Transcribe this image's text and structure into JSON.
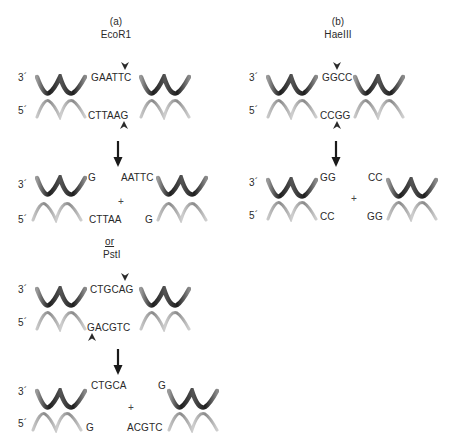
{
  "panels": {
    "a": {
      "label": "(a)",
      "enzyme": "EcoR1",
      "before": {
        "top_seq": "GAATTC",
        "bottom_seq": "CTTAAG"
      },
      "after": {
        "left_top": "G",
        "right_top": "AATTC",
        "left_bottom": "CTTAA",
        "right_bottom": "G"
      },
      "or_label": "or",
      "enzyme2": "PstI",
      "before2": {
        "top_seq": "CTGCAG",
        "bottom_seq": "GACGTC"
      },
      "after2": {
        "left_top": "CTGCA",
        "right_top": "G",
        "left_bottom": "G",
        "right_bottom": "ACGTC"
      }
    },
    "b": {
      "label": "(b)",
      "enzyme": "HaeIII",
      "before": {
        "top_seq": "GGCC",
        "bottom_seq": "CCGG"
      },
      "after": {
        "left_top": "GG",
        "right_top": "CC",
        "left_bottom": "CC",
        "right_bottom": "GG"
      }
    }
  },
  "labels": {
    "three_prime": "3´",
    "five_prime": "5´",
    "plus": "+"
  },
  "colors": {
    "top_strand": "#2b2b2b",
    "bottom_strand": "#9a9a9a",
    "text": "#2a2a2a"
  }
}
